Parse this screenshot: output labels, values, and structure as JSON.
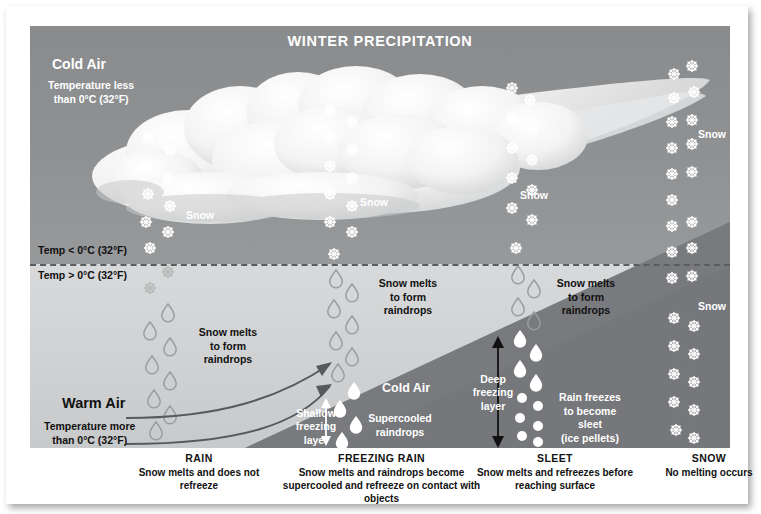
{
  "title": "WINTER PRECIPITATION",
  "air_masses": {
    "cold_top_label": "Cold Air",
    "cold_top_sub": "Temperature less\nthan 0°C (32°F)",
    "warm_label": "Warm Air",
    "warm_sub": "Temperature more\nthan 0°C (32°F)",
    "cold_wedge_label": "Cold Air"
  },
  "boundary": {
    "below_freezing": "Temp < 0°C (32°F)",
    "above_freezing": "Temp > 0°C (32°F)"
  },
  "annotations": {
    "melt_rain": "Snow melts\nto form\nraindrops",
    "melt_freezing_rain": "Snow melts\nto form\nraindrops",
    "melt_sleet": "Snow melts\nto form\nraindrops",
    "shallow_layer": "Shallow\nfreezing\nlayer",
    "supercooled": "Supercooled\nraindrops",
    "deep_layer": "Deep\nfreezing\nlayer",
    "sleet_note": "Rain freezes\nto become\nsleet\n(ice pellets)"
  },
  "snow_labels": [
    "Snow",
    "Snow",
    "Snow",
    "Snow",
    "Snow"
  ],
  "captions": [
    {
      "head": "RAIN",
      "body": "Snow melts and does\nnot refreeze"
    },
    {
      "head": "FREEZING RAIN",
      "body": "Snow melts and raindrops\nbecome supercooled and refreeze\non contact with objects"
    },
    {
      "head": "SLEET",
      "body": "Snow melts and refreezes\nbefore reaching surface"
    },
    {
      "head": "SNOW",
      "body": "No melting occurs"
    }
  ],
  "colors": {
    "cold_sky": "#8f9193",
    "warm_sky": "#d0d1d2",
    "cold_wedge": "#77797b",
    "cloud": "#f2f2f2",
    "text_light": "#ffffff",
    "text_dark": "#1b1b1b",
    "paper": "#ffffff"
  },
  "columns": [
    {
      "name": "rain",
      "x": 170
    },
    {
      "name": "freezing-rain",
      "x": 348
    },
    {
      "name": "sleet",
      "x": 500
    },
    {
      "name": "snow",
      "x": 660
    }
  ]
}
